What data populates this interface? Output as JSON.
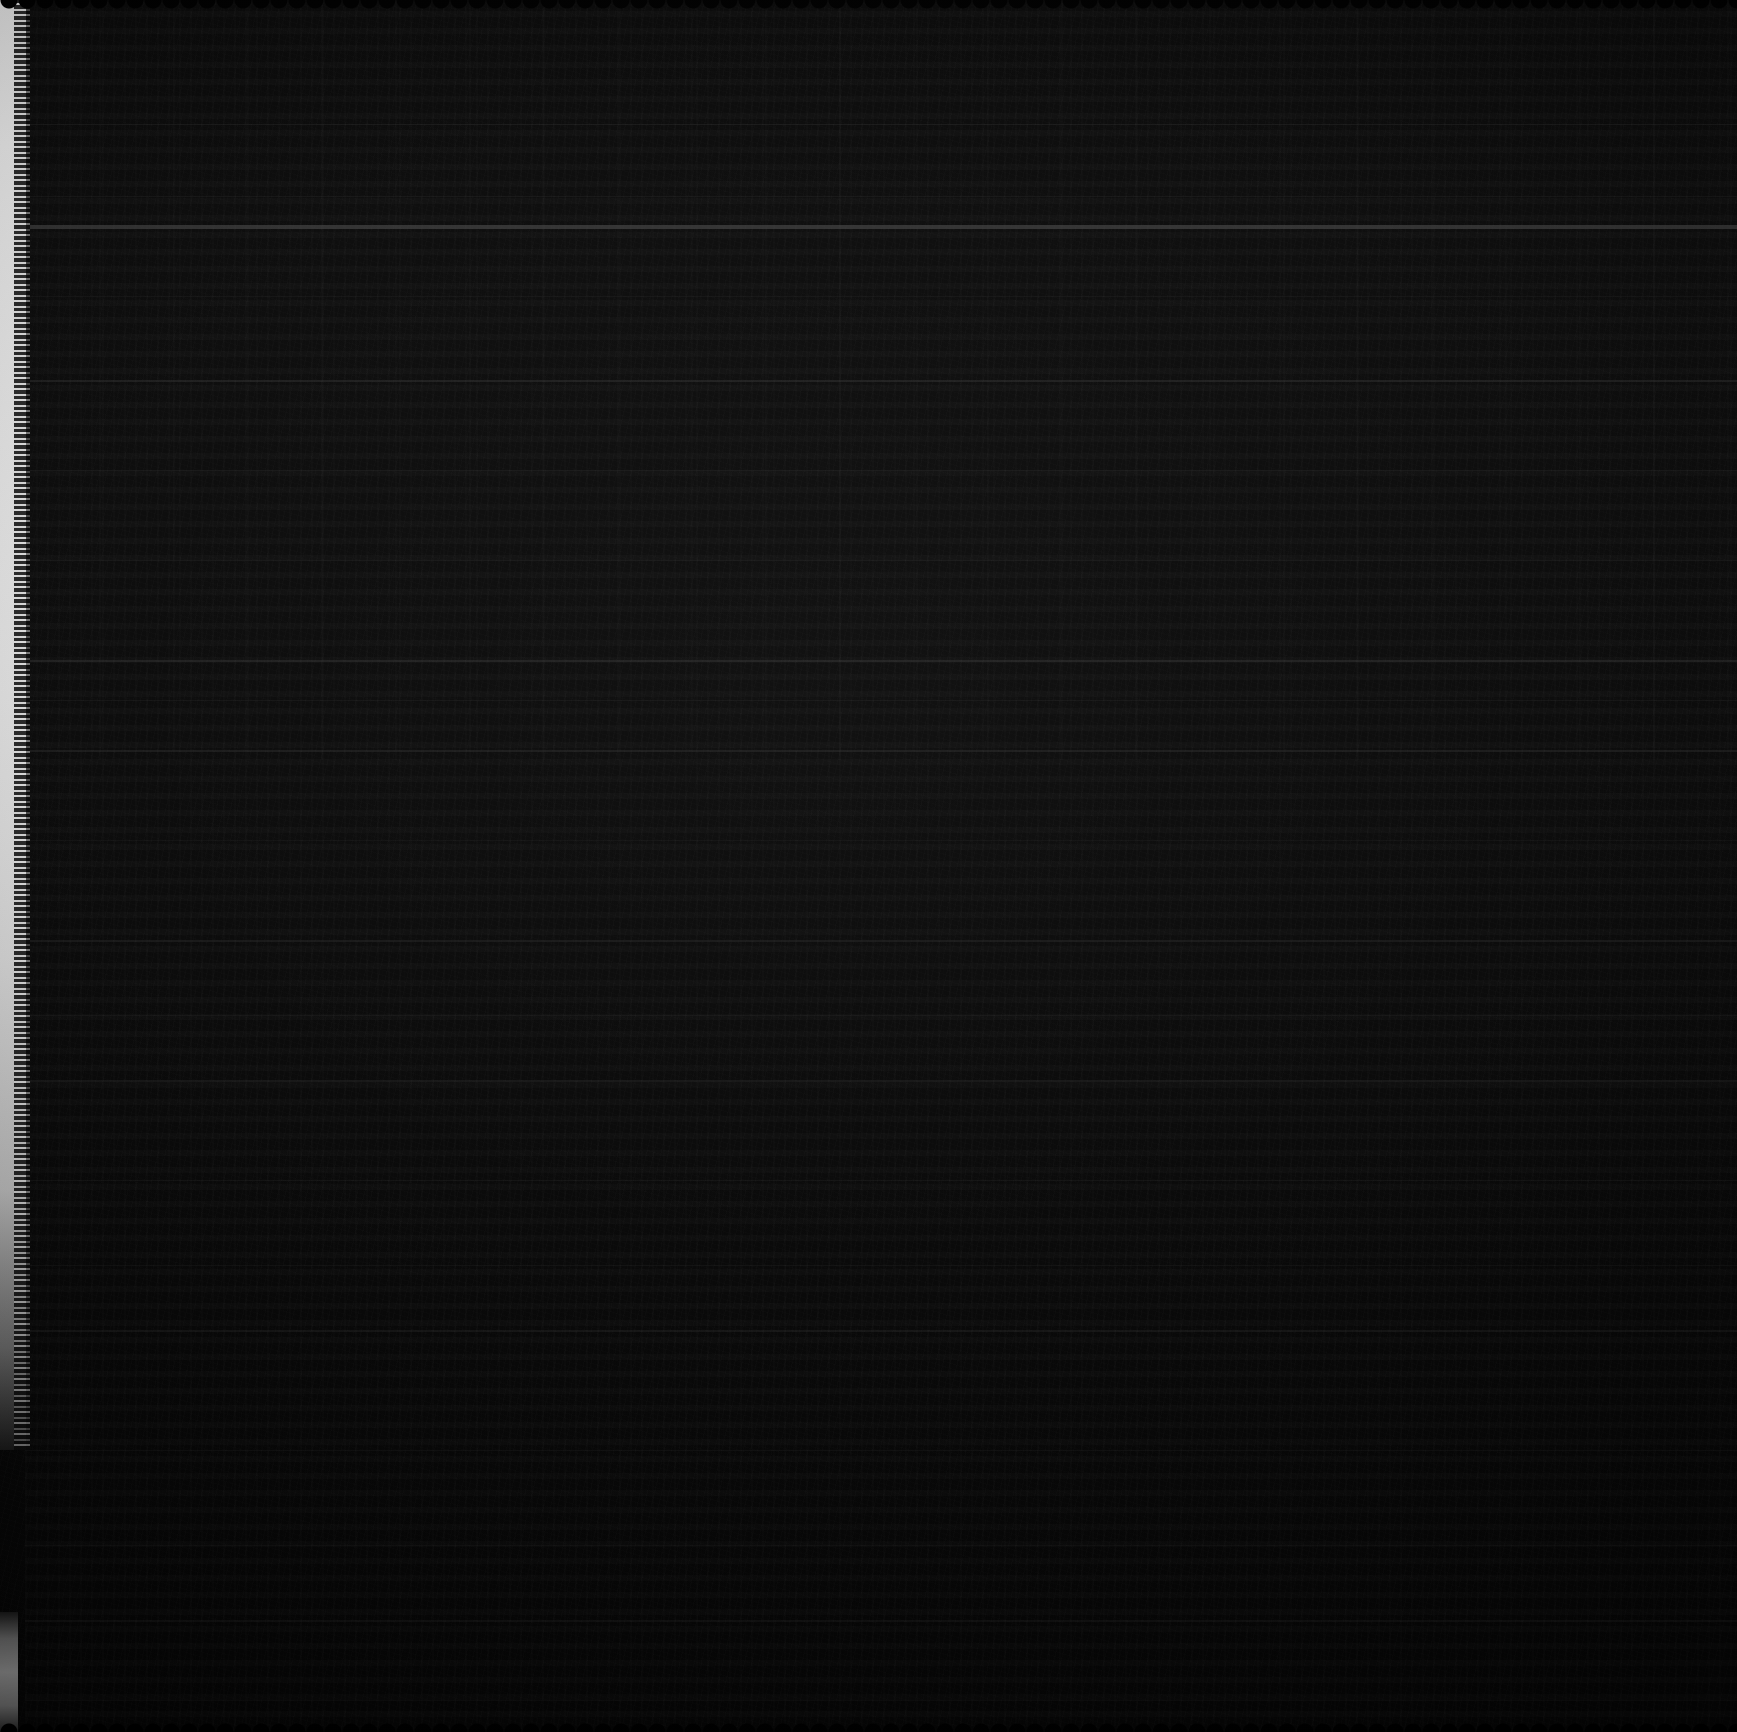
{
  "document": {
    "kind": "scanned-page",
    "legible_text": "",
    "note": "No text is legible; the scan is almost entirely black."
  },
  "canvas": {
    "width": 1737,
    "height": 1732
  },
  "colors": {
    "page_black": "#0a0a0a",
    "page_black_bottom": "#060606",
    "edge_strip_light": "#ededed",
    "edge_strip_mid": "#b9b9b9",
    "edge_strip_dark": "#1a1a1a",
    "rule_bright": "#4a4a4a",
    "rule_faint": "#232323",
    "backdrop": "#000000"
  },
  "edge_strip": {
    "left": 0,
    "width": 26,
    "top": 0,
    "height": 1450,
    "lower_segment_top": 1612,
    "lower_segment_height": 120,
    "lower_segment_width": 18
  },
  "text_block": {
    "left": 25,
    "top": 8,
    "width": 1712,
    "height": 1718,
    "approx_line_height": 17,
    "column_banding_height": 760,
    "column_banding_pitch": 74
  },
  "rules": [
    {
      "y": 124,
      "height": 1,
      "opacity": 0.22
    },
    {
      "y": 196,
      "height": 1,
      "opacity": 0.16
    },
    {
      "y": 225,
      "height": 4,
      "opacity": 0.62
    },
    {
      "y": 296,
      "height": 1,
      "opacity": 0.14
    },
    {
      "y": 380,
      "height": 2,
      "opacity": 0.3
    },
    {
      "y": 470,
      "height": 1,
      "opacity": 0.13
    },
    {
      "y": 560,
      "height": 1,
      "opacity": 0.12
    },
    {
      "y": 660,
      "height": 2,
      "opacity": 0.28
    },
    {
      "y": 700,
      "height": 1,
      "opacity": 0.15
    },
    {
      "y": 750,
      "height": 2,
      "opacity": 0.26
    },
    {
      "y": 840,
      "height": 1,
      "opacity": 0.12
    },
    {
      "y": 940,
      "height": 2,
      "opacity": 0.22
    },
    {
      "y": 1015,
      "height": 1,
      "opacity": 0.12
    },
    {
      "y": 1080,
      "height": 2,
      "opacity": 0.2
    },
    {
      "y": 1180,
      "height": 1,
      "opacity": 0.16
    },
    {
      "y": 1265,
      "height": 1,
      "opacity": 0.13
    },
    {
      "y": 1330,
      "height": 2,
      "opacity": 0.2
    },
    {
      "y": 1450,
      "height": 1,
      "opacity": 0.14
    },
    {
      "y": 1545,
      "height": 1,
      "opacity": 0.12
    },
    {
      "y": 1620,
      "height": 2,
      "opacity": 0.18
    },
    {
      "y": 1700,
      "height": 1,
      "opacity": 0.12
    }
  ],
  "scallop": {
    "top_height": 16,
    "bottom_height": 16,
    "pitch": 18
  }
}
